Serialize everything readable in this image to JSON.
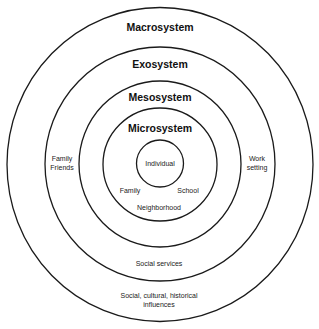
{
  "diagram": {
    "type": "concentric-circles",
    "systems": [
      {
        "name": "Macrosystem",
        "examples": [
          "Social, cultural, historical",
          "influences"
        ]
      },
      {
        "name": "Exosystem",
        "examples": [
          "Social services"
        ]
      },
      {
        "name": "Mesosystem",
        "examples": [
          "Family",
          "Friends",
          "Work",
          "setting"
        ]
      },
      {
        "name": "Microsystem",
        "examples": [
          "Family",
          "School",
          "Neighborhood"
        ]
      },
      {
        "name": "Individual"
      }
    ],
    "labels": {
      "macro_title": "Macrosystem",
      "exo_title": "Exosystem",
      "meso_title": "Mesosystem",
      "micro_title": "Microsystem",
      "individual": "Individual",
      "micro_family": "Family",
      "micro_school": "School",
      "micro_neighborhood": "Neighborhood",
      "meso_left_line1": "Family",
      "meso_left_line2": "Friends",
      "meso_right_line1": "Work",
      "meso_right_line2": "setting",
      "exo_bottom": "Social services",
      "macro_bottom_line1": "Social, cultural, historical",
      "macro_bottom_line2": "influences"
    },
    "colors": {
      "stroke": "#1a1a1a",
      "text": "#111111",
      "background": "#ffffff"
    }
  }
}
